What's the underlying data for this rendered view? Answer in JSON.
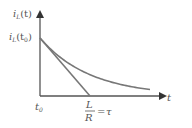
{
  "diagram": {
    "y_axis_label": {
      "main": "i",
      "sub": "L",
      "arg": "(t)"
    },
    "initial_value_label": {
      "main": "i",
      "sub": "L",
      "arg_open": "(t",
      "arg_sub": "0",
      "arg_close": ")"
    },
    "x_axis_label": "t",
    "origin_label": {
      "main": "t",
      "sub": "0"
    },
    "tau_label": {
      "numerator": "L",
      "denominator": "R",
      "equals": "=",
      "symbol": "τ"
    },
    "curve": {
      "type": "exponential-decay",
      "time_constants_shown": 2.2
    },
    "tangent": {
      "intercept_at_tau": 1
    },
    "colors": {
      "axis": "#555555",
      "curve": "#777777",
      "tangent": "#777777",
      "text": "#555555"
    }
  }
}
